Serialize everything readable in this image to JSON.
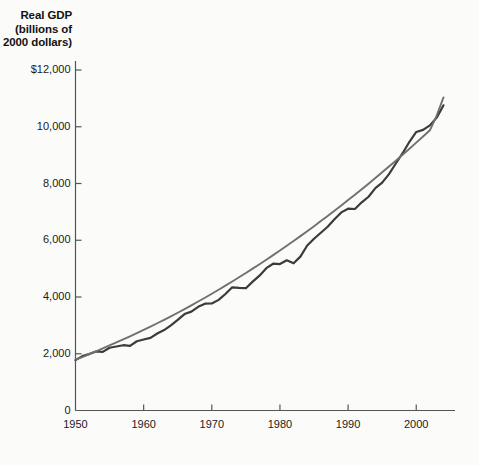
{
  "chart_data": {
    "type": "line",
    "title": "",
    "ylabel": "Real GDP\n(billions of\n2000 dollars)",
    "xlabel": "",
    "ylim": [
      0,
      12000
    ],
    "xlim": [
      1950,
      2004
    ],
    "grid": false,
    "legend": "none",
    "ytick_labels": [
      "$12,000",
      "10,000",
      "8,000",
      "6,000",
      "4,000",
      "2,000",
      "0"
    ],
    "ytick_values": [
      12000,
      10000,
      8000,
      6000,
      4000,
      2000,
      0
    ],
    "xtick_labels": [
      "1950",
      "1960",
      "1970",
      "1980",
      "1990",
      "2000"
    ],
    "xtick_values": [
      1950,
      1960,
      1970,
      1980,
      1990,
      2000
    ],
    "colors": {
      "actual_line": "#3b3b3b",
      "trend_line": "#707070",
      "axis": "#555555",
      "background": "#fbfbfa",
      "text": "#1a1a1a"
    },
    "x": [
      1950,
      1951,
      1952,
      1953,
      1954,
      1955,
      1956,
      1957,
      1958,
      1959,
      1960,
      1961,
      1962,
      1963,
      1964,
      1965,
      1966,
      1967,
      1968,
      1969,
      1970,
      1971,
      1972,
      1973,
      1974,
      1975,
      1976,
      1977,
      1978,
      1979,
      1980,
      1981,
      1982,
      1983,
      1984,
      1985,
      1986,
      1987,
      1988,
      1989,
      1990,
      1991,
      1992,
      1993,
      1994,
      1995,
      1996,
      1997,
      1998,
      1999,
      2000,
      2001,
      2002,
      2003,
      2004
    ],
    "series": [
      {
        "name": "Real GDP (actual)",
        "style": "solid-dark",
        "values": [
          1777,
          1915,
          1988,
          2080,
          2065,
          2213,
          2256,
          2301,
          2279,
          2441,
          2502,
          2560,
          2715,
          2834,
          2999,
          3192,
          3399,
          3485,
          3653,
          3766,
          3772,
          3899,
          4105,
          4342,
          4320,
          4311,
          4541,
          4751,
          5015,
          5173,
          5162,
          5292,
          5189,
          5424,
          5814,
          6054,
          6264,
          6475,
          6743,
          6981,
          7113,
          7101,
          7337,
          7533,
          7836,
          8032,
          8329,
          8704,
          9067,
          9470,
          9817,
          9891,
          10049,
          10321,
          10756
        ]
      },
      {
        "name": "Real GDP (trend)",
        "style": "solid-light",
        "values": [
          1790,
          1885,
          1985,
          2085,
          2190,
          2295,
          2400,
          2505,
          2615,
          2725,
          2840,
          2955,
          3075,
          3195,
          3320,
          3445,
          3575,
          3705,
          3840,
          3975,
          4115,
          4255,
          4400,
          4545,
          4695,
          4845,
          5000,
          5155,
          5315,
          5475,
          5640,
          5805,
          5975,
          6145,
          6320,
          6495,
          6675,
          6855,
          7040,
          7225,
          7415,
          7605,
          7800,
          7995,
          8195,
          8395,
          8600,
          8805,
          9015,
          9225,
          9440,
          9655,
          9875,
          10395,
          11035
        ]
      }
    ],
    "annotations": []
  },
  "geometry": {
    "plot_left": 75.5,
    "plot_bottom": 410.5,
    "plot_right": 455,
    "plot_top": 70,
    "y_per_unit_px": 0.028375,
    "x_per_year_px": 6.815
  }
}
